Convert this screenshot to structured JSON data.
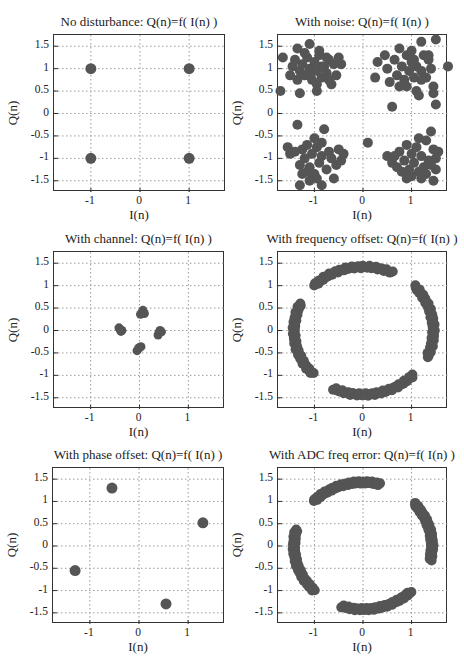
{
  "figure": {
    "marker_color": "#555555",
    "grid_color": "#9a9a9a",
    "axis_color": "#333333"
  },
  "chart_data": [
    {
      "type": "scatter",
      "title": "No disturbance: Q(n)=f( I(n) )",
      "xlabel": "I(n)",
      "ylabel": "Q(n)",
      "xlim": [
        -1.75,
        1.75
      ],
      "ylim": [
        -1.75,
        1.75
      ],
      "xticks": [
        -1,
        0,
        1
      ],
      "xtick_labels": [
        "-1",
        "0",
        "1"
      ],
      "yticks": [
        1.5,
        1,
        0.5,
        0,
        -0.5,
        -1,
        -1.5
      ],
      "ytick_labels": [
        "1.5",
        "1",
        "0.5",
        "0",
        "-0.5",
        "-1",
        "-1.5"
      ],
      "grid": true,
      "points": [
        [
          -1,
          1
        ],
        [
          1,
          1
        ],
        [
          -1,
          -1
        ],
        [
          1,
          -1
        ]
      ]
    },
    {
      "type": "scatter",
      "title": "With noise: Q(n)=f( I(n) )",
      "xlabel": "I(n)",
      "ylabel": "Q(n)",
      "xlim": [
        -1.75,
        1.75
      ],
      "ylim": [
        -1.75,
        1.75
      ],
      "xticks": [
        -1,
        0,
        1
      ],
      "xtick_labels": [
        "-1",
        "0",
        "1"
      ],
      "yticks": [
        1.5,
        1,
        0.5,
        0,
        -0.5,
        -1,
        -1.5
      ],
      "ytick_labels": [
        "1.5",
        "1",
        "0.5",
        "0",
        "-0.5",
        "-1",
        "-1.5"
      ],
      "grid": true,
      "points": [
        [
          -1.65,
          1.25
        ],
        [
          -1.7,
          0.5
        ],
        [
          -1.1,
          1.55
        ],
        [
          -1.35,
          1.45
        ],
        [
          -1.45,
          1.05
        ],
        [
          -1.4,
          1.2
        ],
        [
          -1.3,
          0.95
        ],
        [
          -1.25,
          1.1
        ],
        [
          -1.2,
          0.85
        ],
        [
          -1.15,
          1.25
        ],
        [
          -1.1,
          1.0
        ],
        [
          -1.05,
          0.75
        ],
        [
          -1.0,
          1.15
        ],
        [
          -0.95,
          0.95
        ],
        [
          -0.9,
          1.3
        ],
        [
          -0.85,
          0.8
        ],
        [
          -0.8,
          1.05
        ],
        [
          -0.75,
          0.9
        ],
        [
          -0.7,
          1.2
        ],
        [
          -0.65,
          0.65
        ],
        [
          -0.6,
          1.1
        ],
        [
          -0.55,
          0.85
        ],
        [
          -0.5,
          1.25
        ],
        [
          -0.45,
          1.1
        ],
        [
          -1.3,
          0.45
        ],
        [
          -0.95,
          0.5
        ],
        [
          -1.5,
          0.85
        ],
        [
          -0.9,
          1.4
        ],
        [
          -1.2,
          1.35
        ],
        [
          -0.75,
          1.25
        ],
        [
          -0.95,
          0.65
        ],
        [
          -1.1,
          0.85
        ],
        [
          -0.85,
          1.05
        ],
        [
          -1.35,
          0.75
        ],
        [
          -0.7,
          0.75
        ],
        [
          1.2,
          1.6
        ],
        [
          1.5,
          1.65
        ],
        [
          1.75,
          1.05
        ],
        [
          0.3,
          1.15
        ],
        [
          0.25,
          0.8
        ],
        [
          0.6,
          0.15
        ],
        [
          0.75,
          1.45
        ],
        [
          0.5,
          1.0
        ],
        [
          0.55,
          0.7
        ],
        [
          0.65,
          1.2
        ],
        [
          0.7,
          0.85
        ],
        [
          0.75,
          0.6
        ],
        [
          0.8,
          1.05
        ],
        [
          0.85,
          0.75
        ],
        [
          0.9,
          1.3
        ],
        [
          0.95,
          0.95
        ],
        [
          1.0,
          1.15
        ],
        [
          1.0,
          1.4
        ],
        [
          1.05,
          0.8
        ],
        [
          1.1,
          1.05
        ],
        [
          1.1,
          0.5
        ],
        [
          1.15,
          0.4
        ],
        [
          1.2,
          0.95
        ],
        [
          1.25,
          1.3
        ],
        [
          1.3,
          0.8
        ],
        [
          1.35,
          1.2
        ],
        [
          1.4,
          1.0
        ],
        [
          1.45,
          0.6
        ],
        [
          1.45,
          0.45
        ],
        [
          1.5,
          0.2
        ],
        [
          1.35,
          1.3
        ],
        [
          0.45,
          1.3
        ],
        [
          1.2,
          0.75
        ],
        [
          0.9,
          0.6
        ],
        [
          1.05,
          1.2
        ],
        [
          -1.35,
          -0.25
        ],
        [
          -0.85,
          -1.6
        ],
        [
          0.1,
          -0.65
        ],
        [
          -1.55,
          -0.75
        ],
        [
          -1.5,
          -0.9
        ],
        [
          -1.4,
          -0.85
        ],
        [
          -1.3,
          -1.15
        ],
        [
          -1.25,
          -1.35
        ],
        [
          -1.3,
          -1.6
        ],
        [
          -1.2,
          -1.0
        ],
        [
          -1.15,
          -0.7
        ],
        [
          -1.1,
          -1.2
        ],
        [
          -1.05,
          -0.9
        ],
        [
          -1.0,
          -0.55
        ],
        [
          -1.0,
          -1.35
        ],
        [
          -0.95,
          -0.75
        ],
        [
          -0.9,
          -1.1
        ],
        [
          -0.85,
          -0.95
        ],
        [
          -0.8,
          -0.35
        ],
        [
          -0.75,
          -1.25
        ],
        [
          -0.7,
          -0.85
        ],
        [
          -0.65,
          -1.0
        ],
        [
          -0.6,
          -1.45
        ],
        [
          -0.55,
          -1.15
        ],
        [
          -0.5,
          -0.8
        ],
        [
          -0.45,
          -1.05
        ],
        [
          -0.4,
          -0.9
        ],
        [
          -1.1,
          -1.5
        ],
        [
          -0.95,
          -1.45
        ],
        [
          -1.25,
          -0.8
        ],
        [
          -0.85,
          -0.65
        ],
        [
          -1.15,
          -1.3
        ],
        [
          1.45,
          -1.5
        ],
        [
          0.5,
          -0.95
        ],
        [
          0.6,
          -1.1
        ],
        [
          0.7,
          -1.2
        ],
        [
          0.75,
          -0.85
        ],
        [
          0.8,
          -1.3
        ],
        [
          0.85,
          -1.05
        ],
        [
          0.9,
          -0.7
        ],
        [
          0.95,
          -1.25
        ],
        [
          1.0,
          -0.9
        ],
        [
          1.0,
          -1.4
        ],
        [
          1.05,
          -1.1
        ],
        [
          1.1,
          -0.75
        ],
        [
          1.15,
          -1.3
        ],
        [
          1.2,
          -0.95
        ],
        [
          1.25,
          -1.2
        ],
        [
          1.3,
          -0.6
        ],
        [
          1.3,
          -1.35
        ],
        [
          1.35,
          -1.05
        ],
        [
          1.4,
          -0.4
        ],
        [
          1.45,
          -0.8
        ],
        [
          1.5,
          -1.0
        ],
        [
          1.5,
          -1.25
        ],
        [
          1.55,
          -0.85
        ],
        [
          1.15,
          -0.55
        ],
        [
          0.9,
          -1.45
        ],
        [
          1.2,
          -1.45
        ],
        [
          0.65,
          -0.95
        ],
        [
          1.4,
          -1.15
        ]
      ]
    },
    {
      "type": "scatter",
      "title": "With channel: Q(n)=f( I(n) )",
      "xlabel": "I(n)",
      "ylabel": "Q(n)",
      "xlim": [
        -1.75,
        1.75
      ],
      "ylim": [
        -1.75,
        1.75
      ],
      "xticks": [
        -1,
        0,
        1
      ],
      "xtick_labels": [
        "-1",
        "0",
        "1"
      ],
      "yticks": [
        1.5,
        1,
        0.5,
        0,
        -0.5,
        -1,
        -1.5
      ],
      "ytick_labels": [
        "1.5",
        "1",
        "0.5",
        "0",
        "-0.5",
        "-1",
        "-1.5"
      ],
      "grid": true,
      "points": [
        [
          0.05,
          0.4
        ],
        [
          0.1,
          0.38
        ],
        [
          0.07,
          0.45
        ],
        [
          0.02,
          0.36
        ],
        [
          0.4,
          -0.05
        ],
        [
          0.42,
          0.0
        ],
        [
          0.38,
          -0.1
        ],
        [
          0.45,
          -0.03
        ],
        [
          -0.02,
          -0.4
        ],
        [
          0.03,
          -0.36
        ],
        [
          -0.05,
          -0.45
        ],
        [
          0.0,
          -0.38
        ],
        [
          -0.4,
          0.03
        ],
        [
          -0.36,
          0.0
        ],
        [
          -0.42,
          0.06
        ],
        [
          -0.38,
          -0.02
        ]
      ]
    },
    {
      "type": "scatter",
      "title": "With frequency offset: Q(n)=f( I(n) )",
      "xlabel": "I(n)",
      "ylabel": "Q(n)",
      "xlim": [
        -1.75,
        1.75
      ],
      "ylim": [
        -1.75,
        1.75
      ],
      "xticks": [
        -1,
        0,
        1
      ],
      "xtick_labels": [
        "-1",
        "0",
        "1"
      ],
      "yticks": [
        1.5,
        1,
        0.5,
        0,
        -0.5,
        -1,
        -1.5
      ],
      "ytick_labels": [
        "1.5",
        "1",
        "0.5",
        "0",
        "-0.5",
        "-1",
        "-1.5"
      ],
      "grid": true,
      "arcs": [
        {
          "start_deg": 135,
          "end_deg": 65,
          "radius": 1.42,
          "count": 40
        },
        {
          "start_deg": 43,
          "end_deg": -24,
          "radius": 1.45,
          "count": 40
        },
        {
          "start_deg": 245,
          "end_deg": 316,
          "radius": 1.43,
          "count": 40
        },
        {
          "start_deg": 155,
          "end_deg": 223,
          "radius": 1.42,
          "count": 40
        }
      ]
    },
    {
      "type": "scatter",
      "title": "With phase offset: Q(n)=f( I(n) )",
      "xlabel": "I(n)",
      "ylabel": "Q(n)",
      "xlim": [
        -1.75,
        1.75
      ],
      "ylim": [
        -1.75,
        1.75
      ],
      "xticks": [
        -1,
        0,
        1
      ],
      "xtick_labels": [
        "-1",
        "0",
        "1"
      ],
      "yticks": [
        1.5,
        1,
        0.5,
        0,
        -0.5,
        -1,
        -1.5
      ],
      "ytick_labels": [
        "1.5",
        "1",
        "0.5",
        "0",
        "-0.5",
        "-1",
        "-1.5"
      ],
      "grid": true,
      "points": [
        [
          -0.55,
          1.3
        ],
        [
          1.3,
          0.52
        ],
        [
          -1.3,
          -0.55
        ],
        [
          0.55,
          -1.3
        ]
      ]
    },
    {
      "type": "scatter",
      "title": "With ADC freq error: Q(n)=f( I(n) )",
      "xlabel": "I(n)",
      "ylabel": "Q(n)",
      "xlim": [
        -1.75,
        1.75
      ],
      "ylim": [
        -1.75,
        1.75
      ],
      "xticks": [
        -1,
        0,
        1
      ],
      "xtick_labels": [
        "-1",
        "0",
        "1"
      ],
      "yticks": [
        1.5,
        1,
        0.5,
        0,
        -0.5,
        -1,
        -1.5
      ],
      "ytick_labels": [
        "1.5",
        "1",
        "0.5",
        "0",
        "-0.5",
        "-1",
        "-1.5"
      ],
      "grid": true,
      "arcs": [
        {
          "start_deg": 135,
          "end_deg": 76,
          "radius": 1.43,
          "count": 45
        },
        {
          "start_deg": 42,
          "end_deg": -13,
          "radius": 1.42,
          "count": 45
        },
        {
          "start_deg": 252,
          "end_deg": 314,
          "radius": 1.42,
          "count": 45
        },
        {
          "start_deg": 165,
          "end_deg": 225,
          "radius": 1.42,
          "count": 45
        }
      ]
    }
  ]
}
